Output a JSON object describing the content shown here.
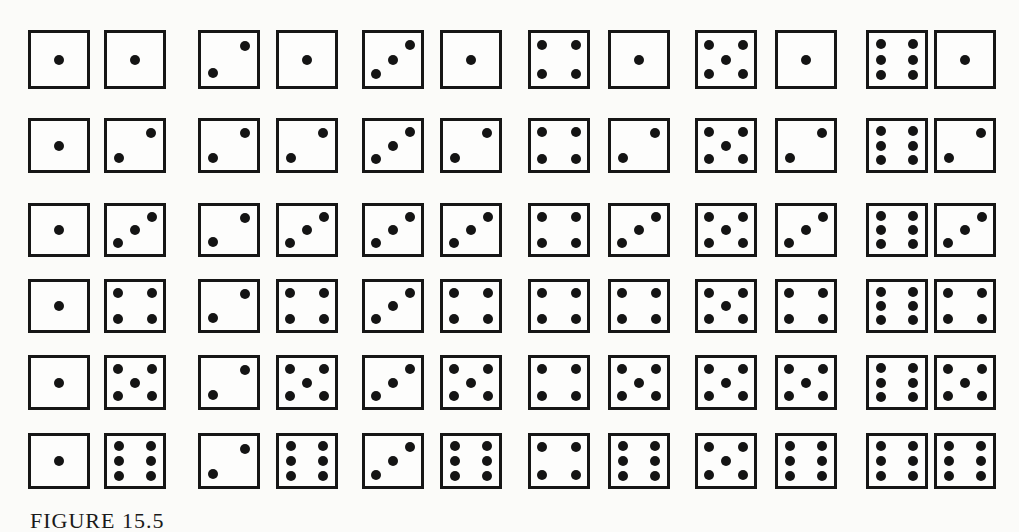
{
  "figure": {
    "caption_partial": "FIGURE 15.5",
    "rows": [
      {
        "row": 1,
        "pairs": [
          [
            1,
            1
          ],
          [
            2,
            1
          ],
          [
            3,
            1
          ],
          [
            4,
            1
          ],
          [
            5,
            1
          ],
          [
            6,
            1
          ]
        ]
      },
      {
        "row": 2,
        "pairs": [
          [
            1,
            2
          ],
          [
            2,
            2
          ],
          [
            3,
            2
          ],
          [
            4,
            2
          ],
          [
            5,
            2
          ],
          [
            6,
            2
          ]
        ]
      },
      {
        "row": 3,
        "pairs": [
          [
            1,
            3
          ],
          [
            2,
            3
          ],
          [
            3,
            3
          ],
          [
            4,
            3
          ],
          [
            5,
            3
          ],
          [
            6,
            3
          ]
        ]
      },
      {
        "row": 4,
        "pairs": [
          [
            1,
            4
          ],
          [
            2,
            4
          ],
          [
            3,
            4
          ],
          [
            4,
            4
          ],
          [
            5,
            4
          ],
          [
            6,
            4
          ]
        ]
      },
      {
        "row": 5,
        "pairs": [
          [
            1,
            5
          ],
          [
            2,
            5
          ],
          [
            3,
            5
          ],
          [
            4,
            5
          ],
          [
            5,
            5
          ],
          [
            6,
            5
          ]
        ]
      },
      {
        "row": 6,
        "pairs": [
          [
            1,
            6
          ],
          [
            2,
            6
          ],
          [
            3,
            6
          ],
          [
            4,
            6
          ],
          [
            5,
            6
          ],
          [
            6,
            6
          ]
        ]
      }
    ],
    "colors": {
      "ink": "#141414",
      "paper": "#fbfbf9"
    }
  }
}
